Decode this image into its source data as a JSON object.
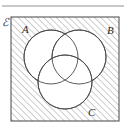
{
  "figure": {
    "kind": "venn-diagram",
    "universe_label": "ℰ",
    "set_labels": {
      "a": "A",
      "b": "B",
      "c": "C"
    },
    "shaded_region_description": "outside all three circles, inside universal set",
    "colors": {
      "background": "#ffffff",
      "hatch_line": "#8a8a8a",
      "circle_stroke": "#4a4a4a",
      "rect_stroke": "#555555",
      "label_text": "#2b2b2b",
      "circle_fill": "#ffffff"
    },
    "geometry": {
      "rect": {
        "x": 11,
        "y": 17,
        "width": 108,
        "height": 104
      },
      "circles": [
        {
          "name": "A",
          "cx": 51,
          "cy": 57,
          "r": 27
        },
        {
          "name": "B",
          "cx": 79,
          "cy": 57,
          "r": 27
        },
        {
          "name": "C",
          "cx": 65,
          "cy": 82,
          "r": 27
        }
      ],
      "hatch_angle_degrees": 45,
      "hatch_spacing": 4.5
    },
    "label_positions": {
      "universe": {
        "x": 2,
        "y": 26
      },
      "a": {
        "x": 22,
        "y": 33
      },
      "b": {
        "x": 107,
        "y": 34
      },
      "c": {
        "x": 88,
        "y": 116
      }
    }
  }
}
